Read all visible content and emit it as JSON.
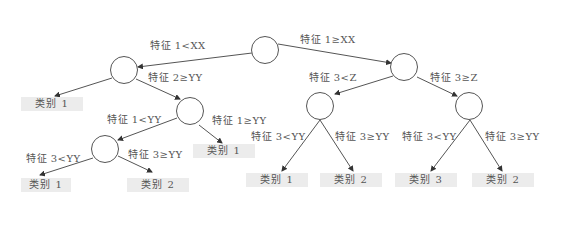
{
  "diagram": {
    "type": "decision-tree",
    "edge_labels": {
      "root_left": "特征 1<XX",
      "root_right": "特征 1≥XX",
      "n1_right": "特征 2≥YY",
      "n2_left": "特征 1<YY",
      "n2_right": "特征 1≥YY",
      "n3_left": "特征 3<YY",
      "n3_right": "特征 3≥YY",
      "r1_left": "特征 3<Z",
      "r1_right": "特征 3≥Z",
      "r2_left": "特征 3<YY",
      "r2_right": "特征 3≥YY",
      "r3_left": "特征 3<YY",
      "r3_right": "特征 3≥YY"
    },
    "leaves": {
      "n1_left": "类别 1",
      "n2_right": "类别 1",
      "n3_left": "类别 1",
      "n3_right": "类别 2",
      "r2_left": "类别 1",
      "r2_right": "类别 2",
      "r3_left": "类别 3",
      "r3_right": "类别 2"
    }
  }
}
